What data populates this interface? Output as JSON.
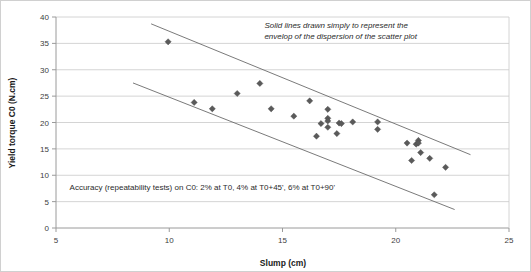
{
  "chart_data": {
    "type": "scatter",
    "title": "",
    "xlabel": "Slump (cm)",
    "ylabel": "Yield torque C0 (N.cm)",
    "xlim": [
      5,
      25
    ],
    "ylim": [
      0,
      40
    ],
    "xticks": [
      5,
      10,
      15,
      20,
      25
    ],
    "yticks": [
      0,
      5,
      10,
      15,
      20,
      25,
      30,
      35,
      40
    ],
    "xtick_labels": [
      "5",
      "10",
      "15",
      "20",
      "25"
    ],
    "ytick_labels": [
      "0",
      "5",
      "10",
      "15",
      "20",
      "25",
      "30",
      "35",
      "40"
    ],
    "grid": "horizontal",
    "legend": "none",
    "series": [
      {
        "name": "Yield torque vs slump",
        "marker": "diamond",
        "color": "#5a5a5a",
        "points": [
          {
            "x": 9.95,
            "y": 35.3
          },
          {
            "x": 11.1,
            "y": 23.8
          },
          {
            "x": 11.9,
            "y": 22.6
          },
          {
            "x": 13.0,
            "y": 25.5
          },
          {
            "x": 14.0,
            "y": 27.4
          },
          {
            "x": 14.5,
            "y": 22.6
          },
          {
            "x": 15.5,
            "y": 21.2
          },
          {
            "x": 16.2,
            "y": 24.1
          },
          {
            "x": 16.5,
            "y": 17.4
          },
          {
            "x": 16.7,
            "y": 19.8
          },
          {
            "x": 17.0,
            "y": 22.5
          },
          {
            "x": 17.0,
            "y": 20.8
          },
          {
            "x": 17.0,
            "y": 20.3
          },
          {
            "x": 17.0,
            "y": 19.1
          },
          {
            "x": 17.4,
            "y": 17.9
          },
          {
            "x": 17.5,
            "y": 19.9
          },
          {
            "x": 17.6,
            "y": 19.8
          },
          {
            "x": 18.1,
            "y": 20.1
          },
          {
            "x": 19.2,
            "y": 20.1
          },
          {
            "x": 19.2,
            "y": 18.7
          },
          {
            "x": 20.5,
            "y": 16.1
          },
          {
            "x": 20.7,
            "y": 12.8
          },
          {
            "x": 20.9,
            "y": 15.9
          },
          {
            "x": 21.0,
            "y": 16.6
          },
          {
            "x": 21.0,
            "y": 16.1
          },
          {
            "x": 21.1,
            "y": 14.3
          },
          {
            "x": 21.5,
            "y": 13.2
          },
          {
            "x": 21.7,
            "y": 6.3
          },
          {
            "x": 22.2,
            "y": 11.5
          }
        ]
      }
    ],
    "envelope_lines": [
      {
        "name": "upper-envelope",
        "x1": 9.2,
        "y1": 38.7,
        "x2": 23.3,
        "y2": 13.9
      },
      {
        "name": "lower-envelope",
        "x1": 8.4,
        "y1": 27.5,
        "x2": 22.6,
        "y2": 3.5
      }
    ],
    "annotations": [
      {
        "name": "envelope-note",
        "lines": [
          "Solid lines drawn simply to represent the",
          "envelop of the dispersion of the scatter plot"
        ],
        "style": "italic",
        "x": 14.2,
        "y": 38.0
      },
      {
        "name": "accuracy-note",
        "lines": [
          "Accuracy (repeatability tests) on C0: 2% at T0, 4% at T0+45', 6% at T0+90'"
        ],
        "style": "normal",
        "x": 5.6,
        "y": 7.2
      }
    ]
  }
}
